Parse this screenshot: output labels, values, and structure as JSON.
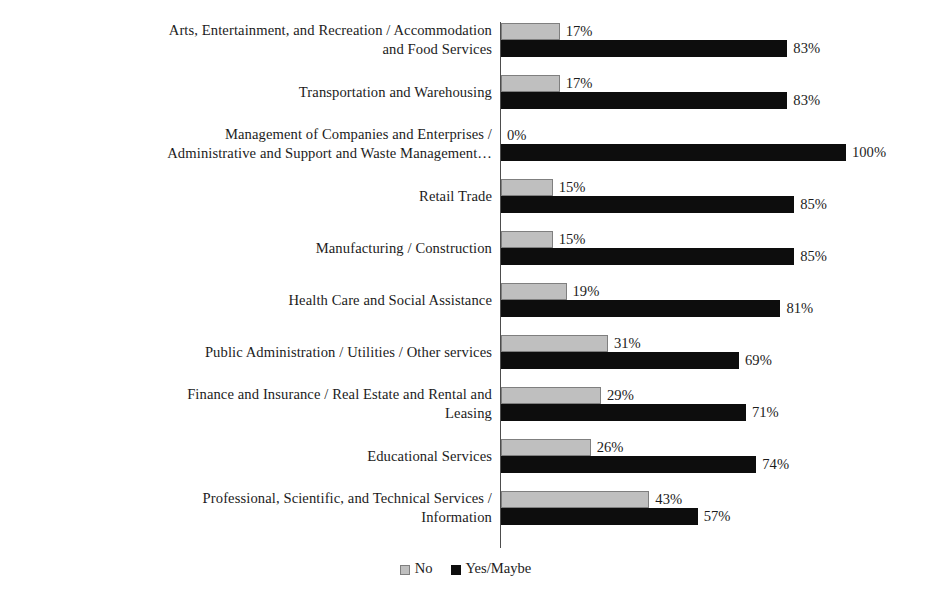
{
  "chart_data": {
    "type": "bar",
    "orientation": "horizontal",
    "title": "",
    "subtitle": "",
    "xlabel": "",
    "ylabel": "",
    "xlim": [
      0,
      100
    ],
    "grid": false,
    "value_suffix": "%",
    "legend_position": "bottom",
    "categories": [
      "Arts, Entertainment, and Recreation / Accommodation\nand Food Services",
      "Transportation and Warehousing",
      "Management of Companies and Enterprises /\nAdministrative and Support and Waste Management…",
      "Retail Trade",
      "Manufacturing / Construction",
      "Health Care and Social Assistance",
      "Public Administration / Utilities / Other services",
      "Finance and Insurance / Real Estate and Rental and\nLeasing",
      "Educational Services",
      "Professional, Scientific, and Technical Services /\nInformation"
    ],
    "series": [
      {
        "name": "No",
        "color": "#bfbfbf",
        "border_color": "#7f7f7f",
        "values": [
          17,
          17,
          0,
          15,
          15,
          19,
          31,
          29,
          26,
          43
        ],
        "labels": [
          "17%",
          "17%",
          "0%",
          "15%",
          "15%",
          "19%",
          "31%",
          "29%",
          "26%",
          "43%"
        ]
      },
      {
        "name": "Yes/Maybe",
        "color": "#0d0d0d",
        "border_color": "#0d0d0d",
        "values": [
          83,
          83,
          100,
          85,
          85,
          81,
          69,
          71,
          74,
          57
        ],
        "labels": [
          "83%",
          "83%",
          "100%",
          "85%",
          "85%",
          "81%",
          "69%",
          "71%",
          "74%",
          "57%"
        ]
      }
    ],
    "legend": [
      {
        "label": "No",
        "color": "#bfbfbf"
      },
      {
        "label": "Yes/Maybe",
        "color": "#0d0d0d"
      }
    ]
  }
}
